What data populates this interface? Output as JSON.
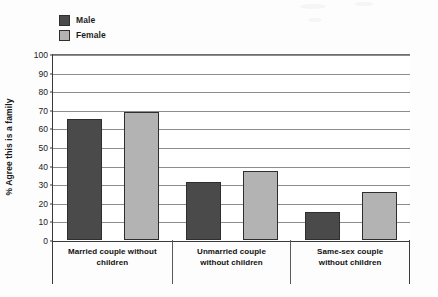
{
  "chart_data": {
    "type": "bar",
    "title": "",
    "xlabel": "",
    "ylabel": "% Agree this is a family",
    "ylim": [
      0,
      100
    ],
    "ytick_step": 10,
    "yticks": [
      100,
      90,
      80,
      70,
      60,
      50,
      40,
      30,
      20,
      10,
      0
    ],
    "grid": true,
    "legend_position": "top-left",
    "categories": [
      "Married couple without\nchildren",
      "Unmarried couple\nwithout children",
      "Same-sex couple\nwithout children"
    ],
    "series": [
      {
        "name": "Male",
        "color": "#4a4a4a",
        "values": [
          65,
          31,
          15
        ]
      },
      {
        "name": "Female",
        "color": "#b3b3b3",
        "values": [
          69,
          37,
          26
        ]
      }
    ]
  },
  "legend": {
    "items": [
      {
        "label": "Male",
        "swatch": "legend-swatch-male"
      },
      {
        "label": "Female",
        "swatch": "legend-swatch-female"
      }
    ]
  }
}
